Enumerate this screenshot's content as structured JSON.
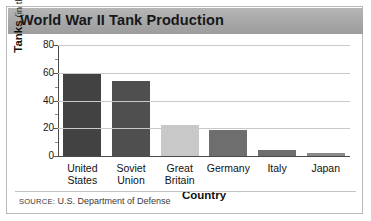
{
  "chart_data": {
    "type": "bar",
    "title": "World War II Tank Production",
    "xlabel": "Country",
    "ylabel_main": "Tanks",
    "ylabel_unit": "(in thousands)",
    "categories": [
      "United States",
      "Soviet Union",
      "Great Britain",
      "Germany",
      "Italy",
      "Japan"
    ],
    "values": [
      60,
      54,
      22,
      19,
      4.5,
      2.5
    ],
    "ylim": [
      0,
      80
    ],
    "yticks": [
      0,
      20,
      40,
      60,
      80
    ],
    "ytick_labels": [
      "0",
      "20",
      "40",
      "60",
      "80"
    ],
    "minor_ticks": [
      10,
      30,
      50,
      70
    ],
    "grid": true,
    "legend": "none",
    "bar_colors": [
      "#424242",
      "#4f4f4f",
      "#c8c8c8",
      "#6e6e6e",
      "#6e6e6e",
      "#8a8a8a"
    ]
  },
  "category_lines": [
    [
      "United",
      "States"
    ],
    [
      "Soviet",
      "Union"
    ],
    [
      "Great",
      "Britain"
    ],
    [
      "Germany",
      ""
    ],
    [
      "Italy",
      ""
    ],
    [
      "Japan",
      ""
    ]
  ],
  "source": {
    "prefix": "SOURCE:",
    "text": "U.S. Department of Defense"
  },
  "colors": {
    "title_band": "#a9a9a9",
    "frame": "#b9b9b9",
    "grid": "#c9c9c9",
    "axis": "#4a4a4a"
  }
}
